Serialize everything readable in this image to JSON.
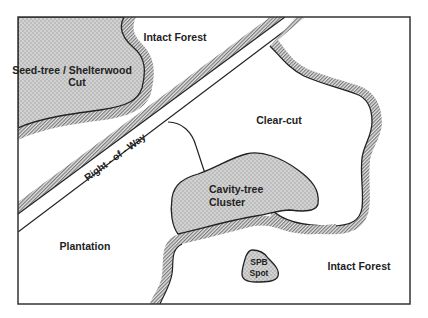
{
  "diagram": {
    "type": "forest-stand map",
    "regions": [
      {
        "id": "seed-tree",
        "label_line1": "Seed-tree / Shelterwood",
        "label_line2": "Cut",
        "fill": "stippled gray"
      },
      {
        "id": "intact-forest-top",
        "label": "Intact Forest"
      },
      {
        "id": "right-of-way",
        "label": "Right - of - Way"
      },
      {
        "id": "clear-cut",
        "label": "Clear-cut"
      },
      {
        "id": "cavity-tree",
        "label_line1": "Cavity-tree",
        "label_line2": "Cluster",
        "fill": "stippled gray"
      },
      {
        "id": "plantation",
        "label": "Plantation"
      },
      {
        "id": "spb-spot",
        "label_line1": "SPB",
        "label_line2": "Spot",
        "fill": "stippled gray"
      },
      {
        "id": "intact-forest-bottom",
        "label": "Intact Forest"
      }
    ]
  },
  "labels": {
    "seed_tree_1": "Seed-tree / Shelterwood",
    "seed_tree_2": "Cut",
    "intact_forest_top": "Intact Forest",
    "right_of_way": "Right - of - Way",
    "clear_cut": "Clear-cut",
    "cavity_1": "Cavity-tree",
    "cavity_2": "Cluster",
    "plantation": "Plantation",
    "spb_1": "SPB",
    "spb_2": "Spot",
    "intact_forest_bottom": "Intact Forest"
  },
  "colors": {
    "stipple_fill": "#c9c9c9",
    "hatch": "#8a8a8a",
    "line": "#222222",
    "background": "#ffffff"
  }
}
